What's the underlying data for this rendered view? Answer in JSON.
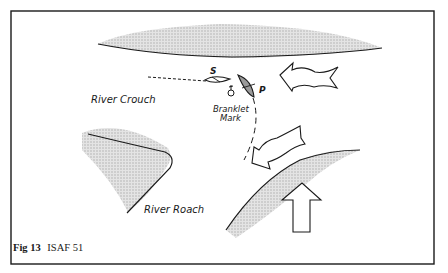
{
  "figure": {
    "caption_prefix": "Fig 13",
    "caption_rule": "ISAF 51",
    "labels": {
      "river_crouch": "River Crouch",
      "river_roach": "River Roach",
      "mark_line1": "Branklet",
      "mark_line2": "Mark",
      "boat_s": "S",
      "boat_p": "P"
    },
    "colors": {
      "ink": "#1a1a1a",
      "shore_shading": "#bdbdbd",
      "background": "#ffffff"
    }
  }
}
